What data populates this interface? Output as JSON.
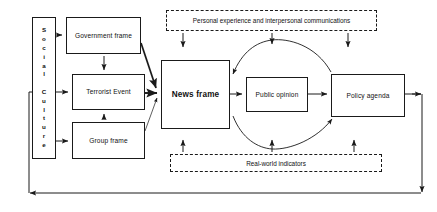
{
  "diagram": {
    "type": "flow-diagram",
    "canvas": {
      "width": 437,
      "height": 212
    },
    "colors": {
      "stroke": "#1a1a1a",
      "fill": "#ffffff",
      "text": "#111111",
      "background": "#ffffff"
    },
    "vertical_box": {
      "name": "social-culture",
      "lines": [
        {
          "word": "Social",
          "letters": [
            "S",
            "o",
            "c",
            "i",
            "a",
            "l"
          ]
        },
        {
          "word": "Culture",
          "letters": [
            "C",
            "u",
            "l",
            "t",
            "u",
            "r",
            "e"
          ]
        }
      ]
    },
    "nodes": [
      {
        "id": "government-frame",
        "label": "Government frame",
        "emphasis": false,
        "x": 66,
        "y": 17,
        "w": 75,
        "h": 37
      },
      {
        "id": "terrorist-event",
        "label": "Terrorist Event",
        "emphasis": false,
        "x": 72,
        "y": 74,
        "w": 73,
        "h": 36
      },
      {
        "id": "group-frame",
        "label": "Group frame",
        "emphasis": false,
        "x": 72,
        "y": 122,
        "w": 73,
        "h": 37
      },
      {
        "id": "news-frame",
        "label": "News frame",
        "emphasis": true,
        "x": 161,
        "y": 60,
        "w": 69,
        "h": 69
      },
      {
        "id": "public-opinion",
        "label": "Public opinion",
        "emphasis": false,
        "x": 246,
        "y": 77,
        "w": 62,
        "h": 35
      },
      {
        "id": "policy-agenda",
        "label": "Policy agenda",
        "emphasis": false,
        "x": 331,
        "y": 74,
        "w": 74,
        "h": 43
      }
    ],
    "dashed_nodes": [
      {
        "id": "personal-experience",
        "label": "Personal experience and interpersonal communications",
        "x": 166,
        "y": 10,
        "w": 211,
        "h": 21
      },
      {
        "id": "real-world-indicators",
        "label": "Real-world indicators",
        "x": 170,
        "y": 154,
        "w": 212,
        "h": 18
      }
    ]
  }
}
